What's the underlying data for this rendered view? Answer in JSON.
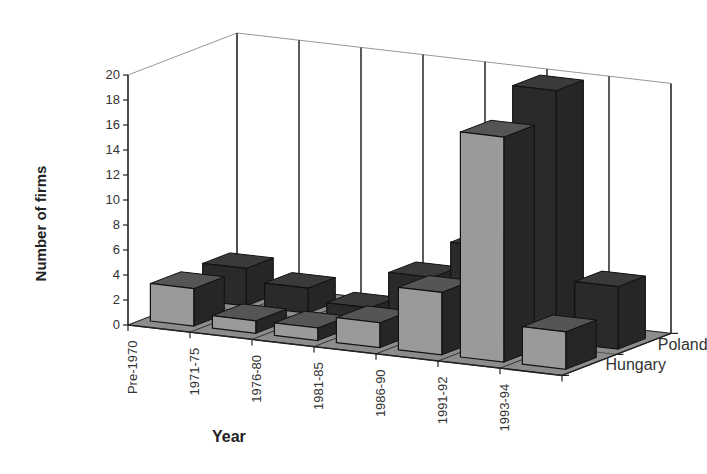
{
  "chart_data": {
    "type": "bar",
    "subtype": "3d-column",
    "title": "",
    "xlabel": "Year",
    "ylabel": "Number of firms",
    "ylim": [
      0,
      20
    ],
    "yticks": [
      0,
      2,
      4,
      6,
      8,
      10,
      12,
      14,
      16,
      18,
      20
    ],
    "categories": [
      "Pre-1970",
      "1971-75",
      "1976-80",
      "1981-85",
      "1986-90",
      "1991-92",
      "1993-94"
    ],
    "series": [
      {
        "name": "Hungary",
        "values": [
          3,
          1,
          1,
          2,
          5,
          18,
          3
        ],
        "color": "#9a9a9a"
      },
      {
        "name": "Poland",
        "values": [
          3,
          2,
          1,
          4,
          7,
          22,
          5
        ],
        "color": "#2a2a2a"
      }
    ],
    "grid": true,
    "legend_position": "depth-axis-right"
  }
}
